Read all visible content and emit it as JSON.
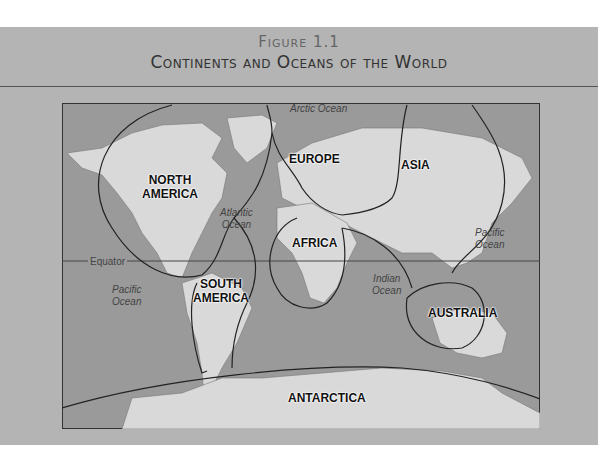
{
  "figure": {
    "label": "Figure 1.1",
    "title": "Continents and Oceans of the World"
  },
  "continents": {
    "north_america": "NORTH\nAMERICA",
    "south_america": "SOUTH\nAMERICA",
    "europe": "EUROPE",
    "asia": "ASIA",
    "africa": "AFRICA",
    "australia": "AUSTRALIA",
    "antarctica": "ANTARCTICA"
  },
  "oceans": {
    "arctic": "Arctic Ocean",
    "atlantic": "Atlantic\nOcean",
    "pacific_west": "Pacific\nOcean",
    "pacific_east": "Pacific\nOcean",
    "indian": "Indian\nOcean"
  },
  "lines": {
    "equator": "Equator"
  },
  "colors": {
    "background": "#b4b4b4",
    "water": "#9a9a9a",
    "land": "#d9d9d9",
    "border": "#333333"
  }
}
